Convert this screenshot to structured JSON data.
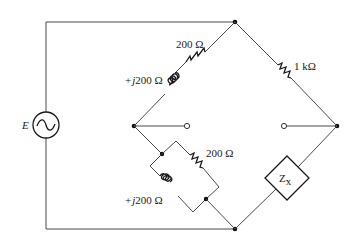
{
  "diagram": {
    "type": "ac-bridge-circuit",
    "source": {
      "label": "E",
      "symbol": "ac-source"
    },
    "arms": {
      "top_left": {
        "resistor": "200 Ω",
        "inductor": "+j200 Ω",
        "connection": "series"
      },
      "top_right": {
        "resistor": "1 kΩ"
      },
      "bottom_left": {
        "resistor": "200 Ω",
        "inductor": "+j200 Ω",
        "connection": "parallel"
      },
      "bottom_right": {
        "impedance": "Z",
        "subscript": "x"
      }
    },
    "labels": {
      "source": "E",
      "r_top_left": "200 Ω",
      "l_top_left_prefix": "+",
      "l_top_left_j": "j",
      "l_top_left_value": "200 Ω",
      "r_top_right": "1 kΩ",
      "r_bottom_left": "200 Ω",
      "l_bottom_left_prefix": "+",
      "l_bottom_left_j": "j",
      "l_bottom_left_value": "200 Ω",
      "zx_main": "Z",
      "zx_sub": "x"
    }
  }
}
